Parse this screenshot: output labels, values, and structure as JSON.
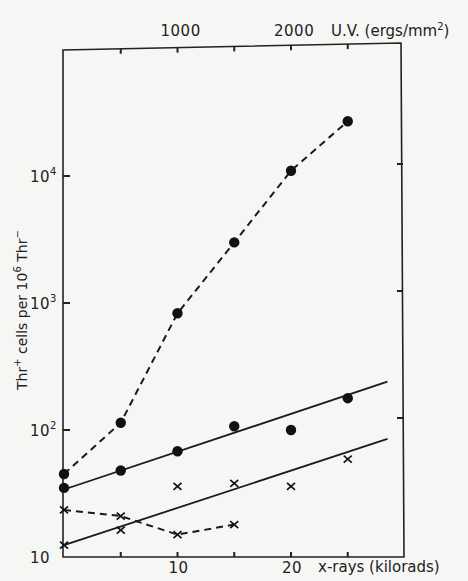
{
  "chart_data": {
    "type": "scatter",
    "title": "",
    "xlabel": "x-rays (kilorads)",
    "x2label": "U.V. (ergs/mm²)",
    "ylabel": "Thr⁺ cells per 10⁶ Thr⁻",
    "yscale": "log",
    "ylim": [
      10,
      100000
    ],
    "xlim": [
      0,
      30
    ],
    "x2lim": [
      0,
      3000
    ],
    "grid": false,
    "legend": "none",
    "x_ticks": [
      0,
      5,
      10,
      15,
      20,
      25
    ],
    "x_tick_labels": [
      {
        "value": 10,
        "label": "10"
      },
      {
        "value": 20,
        "label": "20"
      }
    ],
    "x2_ticks": [
      500,
      1000,
      1500,
      2000,
      2500
    ],
    "x2_tick_labels": [
      {
        "value": 1000,
        "label": "1000"
      },
      {
        "value": 2000,
        "label": "2000"
      }
    ],
    "y_ticks": [
      10,
      100,
      1000,
      10000
    ],
    "y_tick_labels": [
      {
        "value": 10,
        "label": "10",
        "exp": ""
      },
      {
        "value": 100,
        "label": "10",
        "exp": "2"
      },
      {
        "value": 1000,
        "label": "10",
        "exp": "3"
      },
      {
        "value": 10000,
        "label": "10",
        "exp": "4"
      }
    ],
    "series": [
      {
        "name": "U.V. (circles, dashed)",
        "axis": "top",
        "marker": "circle",
        "line": "dashed",
        "x": [
          0,
          500,
          1000,
          1500,
          2000,
          2500
        ],
        "values": [
          45,
          114,
          830,
          3000,
          11000,
          27000
        ]
      },
      {
        "name": "X-rays (circles, fitted solid line)",
        "axis": "bottom",
        "marker": "circle",
        "line": "none",
        "x": [
          0,
          5,
          10,
          15,
          20,
          25
        ],
        "values": [
          35,
          48,
          68,
          107,
          100,
          178
        ],
        "fit": {
          "x": [
            0,
            28.5
          ],
          "values": [
            34,
            240
          ]
        }
      },
      {
        "name": "Crosses (dashed)",
        "axis": "bottom",
        "marker": "cross",
        "line": "dashed",
        "x": [
          0,
          5,
          10,
          15
        ],
        "values": [
          23.5,
          21,
          15,
          18
        ]
      },
      {
        "name": "Crosses (fitted solid line)",
        "axis": "bottom",
        "marker": "cross",
        "line": "none",
        "x": [
          0,
          5,
          10,
          15,
          20,
          25
        ],
        "values": [
          12.4,
          16.3,
          36,
          38,
          36,
          59
        ],
        "fit": {
          "x": [
            0,
            28.5
          ],
          "values": [
            12.4,
            85
          ]
        }
      }
    ]
  },
  "labels": {
    "x_axis_title": "x-rays (kilorads)",
    "x2_axis_title_main": "U.V. (ergs/mm",
    "x2_axis_title_exp": "2",
    "x2_axis_title_end": ")",
    "y_axis_title_a": "Thr",
    "y_axis_title_a_sup": "+",
    "y_axis_title_b": " cells per 10",
    "y_axis_title_b_sup": "6",
    "y_axis_title_c": " Thr",
    "y_axis_title_c_sup": "−"
  }
}
